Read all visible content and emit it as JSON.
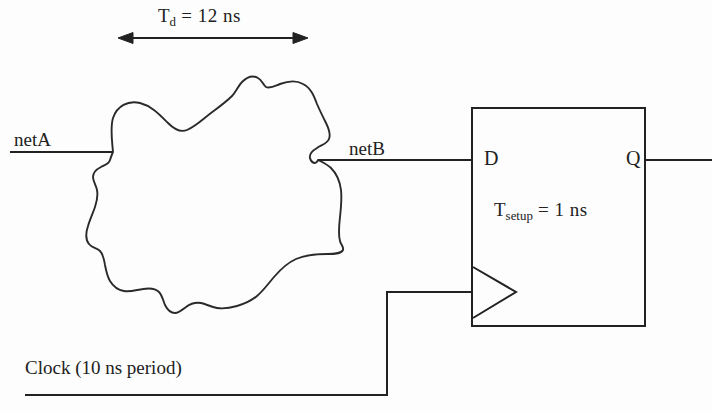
{
  "figure": {
    "background_color": "#fdfdfd",
    "line_color": "#222222",
    "text_color": "#212121"
  },
  "annotations": {
    "delay": {
      "symbol": "T",
      "subscript": "d",
      "equals_value": " = 12 ns",
      "full_text": "Td = 12 ns",
      "value": 12,
      "unit": "ns"
    },
    "setup": {
      "symbol": "T",
      "subscript": "setup",
      "equals_value": " = 1 ns",
      "full_text": "Tsetup = 1 ns",
      "value": 1,
      "unit": "ns"
    },
    "clock": {
      "label": "Clock (10 ns period)",
      "period": 10,
      "unit": "ns"
    }
  },
  "signals": {
    "input_net": "netA",
    "intermediate_net": "netB"
  },
  "flipflop": {
    "data_pin": "D",
    "output_pin": "Q",
    "clock_pin_icon": "clock-triangle-icon"
  },
  "arrow": {
    "name": "delay-span-arrow",
    "style": "double-headed",
    "x_start": 120,
    "x_end": 306,
    "y": 38
  }
}
